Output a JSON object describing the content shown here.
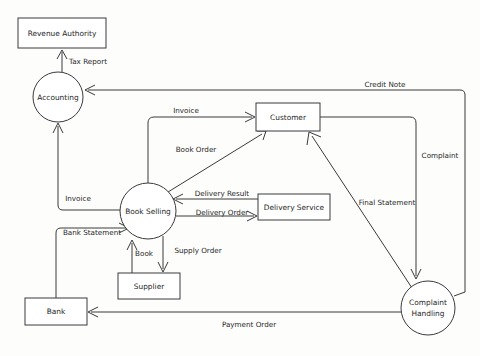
{
  "diagram": {
    "type": "data-flow-diagram",
    "background_color": "#fdfdfc",
    "line_color": "#3a3a3a",
    "text_color": "#262626",
    "nodes": [
      {
        "id": "revenue_authority",
        "label": "Revenue Authority",
        "shape": "rectangle",
        "x": 18,
        "y": 18,
        "w": 88,
        "h": 30
      },
      {
        "id": "accounting",
        "label": "Accounting",
        "shape": "circle",
        "cx": 58,
        "cy": 97,
        "r": 25
      },
      {
        "id": "customer",
        "label": "Customer",
        "shape": "rectangle",
        "x": 256,
        "y": 103,
        "w": 64,
        "h": 28
      },
      {
        "id": "book_selling",
        "label": "Book Selling",
        "shape": "circle",
        "cx": 148,
        "cy": 211,
        "r": 28
      },
      {
        "id": "delivery_service",
        "label": "Delivery Service",
        "shape": "rectangle",
        "x": 258,
        "y": 194,
        "w": 72,
        "h": 26
      },
      {
        "id": "supplier",
        "label": "Supplier",
        "shape": "rectangle",
        "x": 118,
        "y": 273,
        "w": 62,
        "h": 26
      },
      {
        "id": "bank",
        "label": "Bank",
        "shape": "rectangle",
        "x": 25,
        "y": 298,
        "w": 62,
        "h": 27
      },
      {
        "id": "complaint_handling",
        "label": "Complaint Handling",
        "label_line1": "Complaint",
        "label_line2": "Handling",
        "shape": "circle",
        "cx": 428,
        "cy": 308,
        "r": 27
      }
    ],
    "flows": [
      {
        "id": "tax_report",
        "label": "Tax Report",
        "from": "accounting",
        "to": "revenue_authority",
        "label_x": 88,
        "label_y": 62
      },
      {
        "id": "credit_note",
        "label": "Credit Note",
        "from": "complaint_handling",
        "to": "accounting",
        "label_x": 385,
        "label_y": 85
      },
      {
        "id": "invoice_to_customer",
        "label": "Invoice",
        "from": "book_selling",
        "to": "customer",
        "label_x": 186,
        "label_y": 111
      },
      {
        "id": "book_order",
        "label": "Book Order",
        "from": "book_selling",
        "to": "customer",
        "label_x": 196,
        "label_y": 150
      },
      {
        "id": "complaint",
        "label": "Complaint",
        "from": "customer",
        "to": "complaint_handling",
        "label_x": 440,
        "label_y": 156
      },
      {
        "id": "delivery_result",
        "label": "Delivery Result",
        "from": "delivery_service",
        "to": "book_selling",
        "label_x": 222,
        "label_y": 194
      },
      {
        "id": "delivery_order",
        "label": "Delivery Order",
        "from": "book_selling",
        "to": "delivery_service",
        "label_x": 222,
        "label_y": 213
      },
      {
        "id": "final_statement",
        "label": "Final Statement",
        "from": "complaint_handling",
        "to": "customer",
        "label_x": 387,
        "label_y": 203
      },
      {
        "id": "invoice_to_accounting",
        "label": "Invoice",
        "from": "book_selling",
        "to": "accounting",
        "label_x": 78,
        "label_y": 199
      },
      {
        "id": "bank_statement",
        "label": "Bank Statement",
        "from": "bank",
        "to": "book_selling",
        "label_x": 92,
        "label_y": 233
      },
      {
        "id": "book",
        "label": "Book",
        "from": "supplier",
        "to": "book_selling",
        "label_x": 144,
        "label_y": 254
      },
      {
        "id": "supply_order",
        "label": "Supply Order",
        "from": "book_selling",
        "to": "supplier",
        "label_x": 198,
        "label_y": 251
      },
      {
        "id": "payment_order",
        "label": "Payment Order",
        "from": "complaint_handling",
        "to": "bank",
        "label_x": 249,
        "label_y": 325
      }
    ]
  }
}
